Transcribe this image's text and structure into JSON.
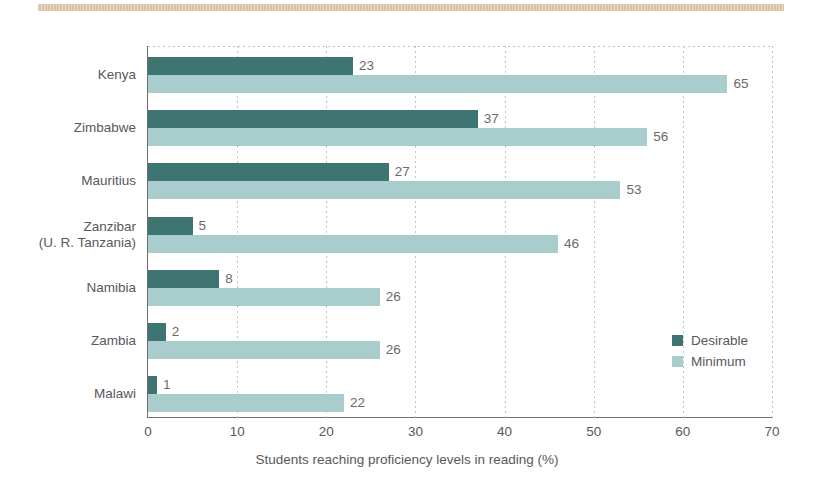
{
  "decoration": {
    "top_rule_color": "#dcc3a8"
  },
  "chart_data": {
    "type": "bar",
    "orientation": "horizontal",
    "title": "",
    "subtitle": "",
    "xlabel": "Students reaching proficiency levels in reading (%)",
    "ylabel": "",
    "xlim": [
      0,
      70
    ],
    "xticks": [
      "0",
      "10",
      "20",
      "30",
      "40",
      "50",
      "60",
      "70"
    ],
    "xtick_values": [
      0,
      10,
      20,
      30,
      40,
      50,
      60,
      70
    ],
    "grid": "vertical-dotted",
    "legend_position": "inside-bottom-right",
    "categories": [
      "Kenya",
      "Zimbabwe",
      "Mauritius",
      "Zanzibar\n(U. R. Tanzania)",
      "Namibia",
      "Zambia",
      "Malawi"
    ],
    "category_lines": [
      [
        "Kenya"
      ],
      [
        "Zimbabwe"
      ],
      [
        "Mauritius"
      ],
      [
        "Zanzibar",
        "(U. R. Tanzania)"
      ],
      [
        "Namibia"
      ],
      [
        "Zambia"
      ],
      [
        "Malawi"
      ]
    ],
    "series": [
      {
        "name": "Desirable",
        "color": "#3e7471",
        "values": [
          23,
          37,
          27,
          5,
          8,
          2,
          1
        ]
      },
      {
        "name": "Minimum",
        "color": "#a9cdcd",
        "values": [
          65,
          56,
          53,
          46,
          26,
          26,
          22
        ]
      }
    ]
  },
  "legend": {
    "entries": [
      {
        "label": "Desirable",
        "color": "#3e7471"
      },
      {
        "label": "Minimum",
        "color": "#a9cdcd"
      }
    ]
  }
}
